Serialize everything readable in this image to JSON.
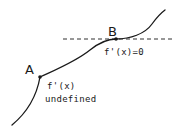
{
  "diagram": {
    "title": "",
    "points": [
      {
        "id": "A",
        "label": "A",
        "annotation_lines": [
          "f'(x)",
          "undefined"
        ]
      },
      {
        "id": "B",
        "label": "B",
        "annotation_lines": [
          "f'(x)=0"
        ]
      }
    ],
    "tangent_line": {
      "style": "dashed",
      "at_point": "B",
      "orientation": "horizontal"
    },
    "colors": {
      "stroke": "#1a1a1a",
      "background": "#ffffff"
    }
  }
}
